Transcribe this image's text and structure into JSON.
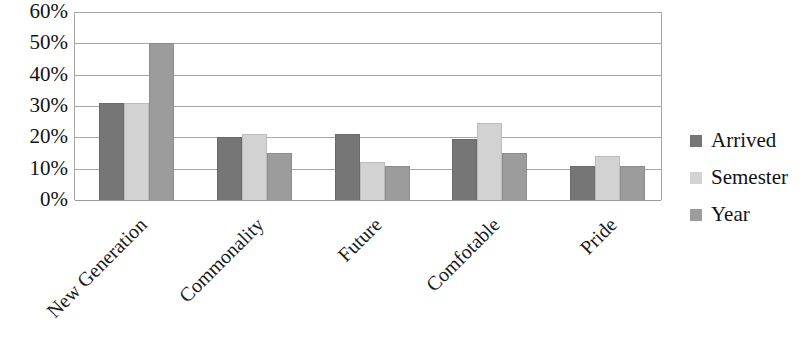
{
  "chart_data": {
    "type": "bar",
    "title": "",
    "subtitle": "",
    "xlabel": "",
    "ylabel": "",
    "categories": [
      "New Generation",
      "Commonality",
      "Future",
      "Comfotable",
      "Pride"
    ],
    "series": [
      {
        "name": "Arrived",
        "color": "#767676",
        "values": [
          31,
          20,
          21,
          19.5,
          11
        ]
      },
      {
        "name": "Semester",
        "color": "#d2d2d2",
        "values": [
          31,
          21,
          12,
          24.5,
          14
        ]
      },
      {
        "name": "Year",
        "color": "#9c9c9c",
        "values": [
          50,
          15,
          11,
          15,
          11
        ]
      }
    ],
    "ylim": [
      0,
      60
    ],
    "ytick_values": [
      60,
      50,
      40,
      30,
      20,
      10,
      0
    ],
    "ytick_labels": [
      "60%",
      "50%",
      "40%",
      "30%",
      "20%",
      "10%",
      "0%"
    ],
    "grid": true,
    "grid_axis": "y",
    "legend_position": "right",
    "bar_group_order": [
      "Arrived",
      "Semester",
      "Year"
    ],
    "axis_color": "#a6a6a6",
    "background_color": "#ffffff",
    "category_label_rotation": -45
  }
}
